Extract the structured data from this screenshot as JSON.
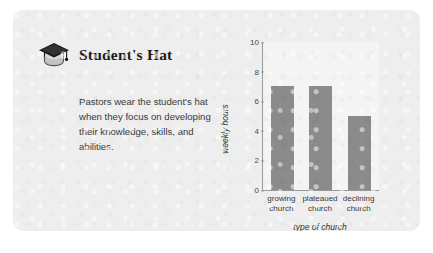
{
  "card": {
    "title": "Student's Hat",
    "icon": "graduation-cap-icon",
    "body": "Pastors wear the student's hat when they focus on developing their knowledge, skills, and abilities.",
    "background_color": "#eeeeee"
  },
  "chart_data": {
    "type": "bar",
    "title": "",
    "categories": [
      "growing church",
      "plateaued church",
      "declining church"
    ],
    "category_lines": [
      [
        "growing",
        "church"
      ],
      [
        "plateaued",
        "church"
      ],
      [
        "declining",
        "church"
      ]
    ],
    "values": [
      7,
      7,
      5
    ],
    "xlabel": "type of church",
    "ylabel": "weekly hours",
    "ylim": [
      0,
      10
    ],
    "yticks": [
      10,
      8,
      6,
      4,
      2,
      0
    ],
    "grid": false,
    "legend": false,
    "bar_color": "#8b8b8b",
    "plot_background": "#f4f4f4",
    "axis_color": "#9a9a9a"
  }
}
